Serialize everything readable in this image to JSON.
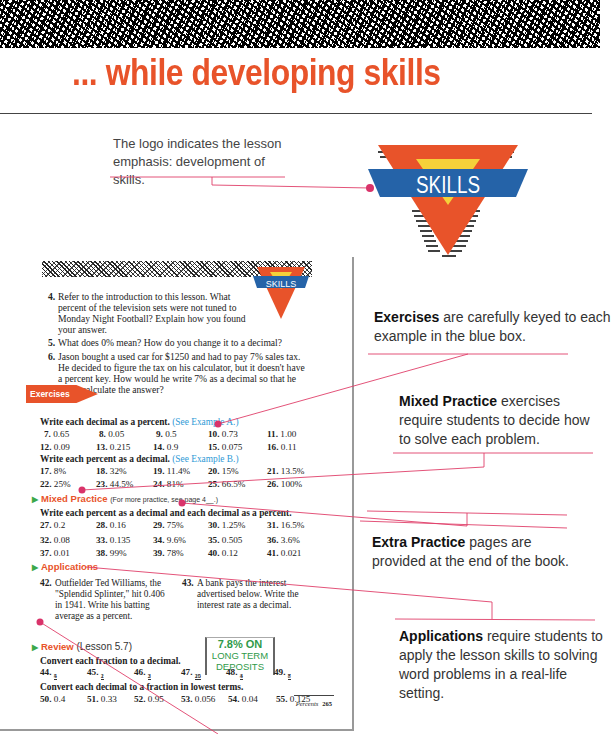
{
  "header": {
    "title": "... while developing skills"
  },
  "logo": {
    "text": "SKILLS",
    "colors": {
      "triangle": "#e8532a",
      "inner": "#f5d13a",
      "band": "#2563a8",
      "text": "#ffffff"
    }
  },
  "callouts": {
    "logo": "The logo indicates the lesson emphasis: development of skills.",
    "exercises": {
      "bold": "Exercises",
      "text": " are carefully keyed to each example in the blue box."
    },
    "mixed_practice": {
      "bold": "Mixed Practice",
      "text": " exercises require students to decide how to solve each problem."
    },
    "extra_practice": {
      "bold": "Extra Practice",
      "text": " pages are provided at the end of the book."
    },
    "applications": {
      "bold": "Applications",
      "text": " require students to apply the lesson skills to solving word problems in a real-life setting."
    }
  },
  "colors": {
    "accent": "#e8532a",
    "callout_line": "#e0406a",
    "dot": "#d9336a",
    "reference_blue": "#2f9ad6",
    "green": "#3aa84a"
  },
  "page": {
    "logo_text": "SKILLS",
    "questions": [
      {
        "n": "4.",
        "text": "Refer to the introduction to this lesson. What percent of the television sets were not tuned to Monday Night Football? Explain how you found your answer."
      },
      {
        "n": "5.",
        "text": "What does 0% mean? How do you change it to a decimal?"
      },
      {
        "n": "6.",
        "text": "Jason bought a used car for $1250 and had to pay 7% sales tax. He decided to figure the tax on his calculator, but it doesn't have a percent key. How would he write 7% as a decimal so that he could calculate the answer?"
      }
    ],
    "exercises_label": "Exercises",
    "exercises": {
      "instr1": "Write each decimal as a percent.",
      "ref1": "(See Example A.)",
      "row1": [
        [
          "7.",
          "0.65"
        ],
        [
          "8.",
          "0.05"
        ],
        [
          "9.",
          "0.5"
        ],
        [
          "10.",
          "0.73"
        ],
        [
          "11.",
          "1.00"
        ]
      ],
      "row2": [
        [
          "12.",
          "0.09"
        ],
        [
          "13.",
          "0.215"
        ],
        [
          "14.",
          "0.9"
        ],
        [
          "15.",
          "0.075"
        ],
        [
          "16.",
          "0.11"
        ]
      ],
      "instr2": "Write each percent as a decimal.",
      "ref2": "(See Example B.)",
      "row3": [
        [
          "17.",
          "8%"
        ],
        [
          "18.",
          "32%"
        ],
        [
          "19.",
          "11.4%"
        ],
        [
          "20.",
          "15%"
        ],
        [
          "21.",
          "13.5%"
        ]
      ],
      "row4": [
        [
          "22.",
          "25%"
        ],
        [
          "23.",
          "44.5%"
        ],
        [
          "24.",
          "81%"
        ],
        [
          "25.",
          "66.5%"
        ],
        [
          "26.",
          "100%"
        ]
      ]
    },
    "mixed_practice": {
      "label": "Mixed Practice",
      "note": "(For more practice, see page 4__.)",
      "instr": "Write each percent as a decimal and each decimal as a percent.",
      "row1": [
        [
          "27.",
          "0.2"
        ],
        [
          "28.",
          "0.16"
        ],
        [
          "29.",
          "75%"
        ],
        [
          "30.",
          "1.25%"
        ],
        [
          "31.",
          "16.5%"
        ]
      ],
      "row2": [
        [
          "32.",
          "0.08"
        ],
        [
          "33.",
          "0.135"
        ],
        [
          "34.",
          "9.6%"
        ],
        [
          "35.",
          "0.505"
        ],
        [
          "36.",
          "3.6%"
        ]
      ],
      "row3": [
        [
          "37.",
          "0.01"
        ],
        [
          "38.",
          "99%"
        ],
        [
          "39.",
          "78%"
        ],
        [
          "40.",
          "0.12"
        ],
        [
          "41.",
          "0.021"
        ]
      ]
    },
    "applications": {
      "label": "Applications",
      "q42": {
        "n": "42.",
        "text": "Outfielder Ted Williams, the \"Splendid Splinter,\" hit 0.406 in 1941. Write his batting average as a percent."
      },
      "q43": {
        "n": "43.",
        "text": "A bank pays the interest advertised below. Write the interest rate as a decimal."
      },
      "sign": {
        "line1": "7.8% ON",
        "line2": "LONG TERM",
        "line3": "DEPOSITS"
      }
    },
    "review": {
      "label": "Review",
      "lesson": "(Lesson 5.7)",
      "instr1": "Convert each fraction to a decimal.",
      "fractions": [
        [
          "44.",
          "4",
          "5"
        ],
        [
          "45.",
          "1",
          "2"
        ],
        [
          "46.",
          "2",
          "3"
        ],
        [
          "47.",
          "15",
          "20"
        ],
        [
          "48.",
          "3",
          "4"
        ],
        [
          "49.",
          "7",
          "8"
        ]
      ],
      "instr2": "Convert each decimal to a fraction in lowest terms.",
      "decimals": [
        [
          "50.",
          "0.4"
        ],
        [
          "51.",
          "0.33"
        ],
        [
          "52.",
          "0.95"
        ],
        [
          "53.",
          "0.056"
        ],
        [
          "54.",
          "0.04"
        ],
        [
          "55.",
          "0.125"
        ]
      ]
    },
    "footer": {
      "section": "Percents",
      "page_number": "265"
    }
  }
}
